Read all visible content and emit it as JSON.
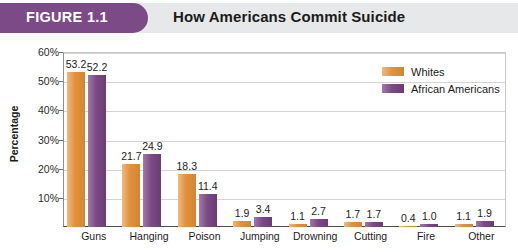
{
  "figure": {
    "badge_label": "FIGURE 1.1",
    "title": "How Americans Commit Suicide",
    "badge_color": "#7c4a86",
    "header_background": "#e7e8ea"
  },
  "legend": {
    "position": "top-right",
    "entries": [
      {
        "label": "Whites",
        "color": "#e2923f"
      },
      {
        "label": "African Americans",
        "color": "#7c4a86"
      }
    ]
  },
  "axis": {
    "y_title": "Percentage",
    "y_ticks": [
      "10%",
      "20%",
      "30%",
      "40%",
      "50%",
      "60%"
    ]
  },
  "chart_data": {
    "type": "bar",
    "title": "How Americans Commit Suicide",
    "xlabel": "",
    "ylabel": "Percentage",
    "ylim": [
      0,
      60
    ],
    "ytick_values": [
      0,
      10,
      20,
      30,
      40,
      50,
      60
    ],
    "grid": "horizontal",
    "legend_position": "top-right",
    "categories": [
      "Guns",
      "Hanging",
      "Poison",
      "Jumping",
      "Drowning",
      "Cutting",
      "Fire",
      "Other"
    ],
    "series": [
      {
        "name": "Whites",
        "color": "#e2923f",
        "values": [
          53.2,
          21.7,
          18.3,
          1.9,
          1.1,
          1.7,
          0.4,
          1.1
        ],
        "labels": [
          "53.2",
          "21.7",
          "18.3",
          "1.9",
          "1.1",
          "1.7",
          "0.4",
          "1.1"
        ]
      },
      {
        "name": "African Americans",
        "color": "#7c4a86",
        "values": [
          52.2,
          24.9,
          11.4,
          3.4,
          2.7,
          1.7,
          1.0,
          1.9
        ],
        "labels": [
          "52.2",
          "24.9",
          "11.4",
          "3.4",
          "2.7",
          "1.7",
          "1.0",
          "1.9"
        ]
      }
    ]
  }
}
